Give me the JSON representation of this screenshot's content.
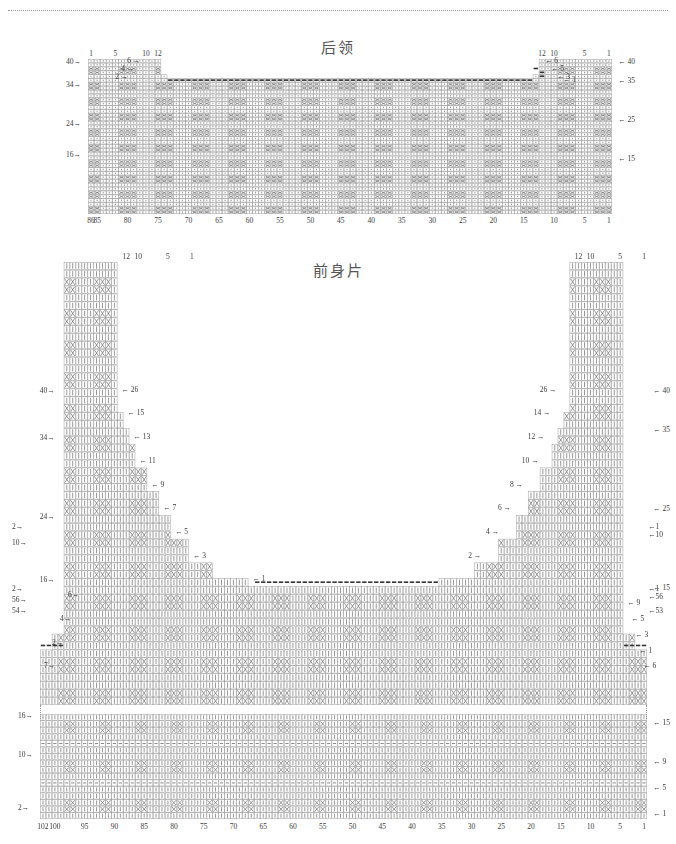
{
  "page": {
    "width": 676,
    "height": 844,
    "background": "#ffffff",
    "ink": "#3a3a3a"
  },
  "charts": [
    {
      "id": "back-collar",
      "title": "后领",
      "title_meaning": "back-neck-piece",
      "cols": 86,
      "rows": 40,
      "bottom_axis_ticks": [
        86,
        85,
        80,
        75,
        70,
        65,
        60,
        55,
        50,
        45,
        40,
        35,
        30,
        25,
        20,
        15,
        10,
        5,
        1
      ],
      "top_axis_left_ticks": [
        12,
        10,
        5,
        1
      ],
      "top_axis_right_ticks": [
        12,
        10,
        5,
        1
      ],
      "left_row_labels": [
        {
          "row": 40,
          "text": "40"
        },
        {
          "row": 34,
          "text": "34"
        },
        {
          "row": 24,
          "text": "24"
        },
        {
          "row": 16,
          "text": "16"
        }
      ],
      "right_row_labels": [
        {
          "row": 40,
          "text": "40"
        },
        {
          "row": 35,
          "text": "35"
        },
        {
          "row": 25,
          "text": "25"
        },
        {
          "row": 15,
          "text": "15"
        }
      ],
      "left_shoulder_steps": [
        {
          "text": "6",
          "row": 40
        },
        {
          "text": "5",
          "row": 38
        },
        {
          "text": "3",
          "row": 36
        },
        {
          "text": "1",
          "row": 35
        }
      ],
      "right_shoulder_steps": [
        {
          "text": "6",
          "row": 40
        },
        {
          "text": "4",
          "row": 38
        },
        {
          "text": "2",
          "row": 36
        }
      ]
    },
    {
      "id": "front-body",
      "title": "前身片",
      "title_meaning": "front-body-piece",
      "cols": 102,
      "rows": 56,
      "bottom_axis_ticks": [
        102,
        100,
        95,
        90,
        85,
        80,
        75,
        70,
        65,
        60,
        55,
        50,
        45,
        40,
        35,
        30,
        25,
        20,
        15,
        10,
        5,
        1
      ],
      "top_axis_left_ticks": [
        12,
        10,
        5,
        1
      ],
      "top_axis_right_ticks": [
        12,
        10,
        5,
        1
      ],
      "left_row_labels": [
        {
          "row": 40,
          "text": "40"
        },
        {
          "row": 34,
          "text": "34"
        },
        {
          "row": 24,
          "text": "24"
        },
        {
          "row": 16,
          "text": "16"
        },
        {
          "row": 9,
          "text": "9"
        },
        {
          "row": 2,
          "text": "2"
        },
        {
          "row": 10,
          "text": "10"
        },
        {
          "row": 56,
          "text": "56"
        },
        {
          "row": 54,
          "text": "54"
        }
      ],
      "right_row_labels": [
        {
          "row": 40,
          "text": "40"
        },
        {
          "row": 35,
          "text": "35"
        },
        {
          "row": 25,
          "text": "25"
        },
        {
          "row": 15,
          "text": "15"
        },
        {
          "row": 9,
          "text": "9"
        },
        {
          "row": 1,
          "text": "1"
        },
        {
          "row": 10,
          "text": "10"
        },
        {
          "row": 56,
          "text": "56"
        },
        {
          "row": 53,
          "text": "53"
        }
      ],
      "left_neck_steps": [
        "26",
        "15",
        "13",
        "11",
        "9",
        "7",
        "5",
        "3",
        "1"
      ],
      "right_neck_steps": [
        "26",
        "14",
        "12",
        "10",
        "8",
        "6",
        "4",
        "2"
      ],
      "left_armhole_steps": [
        "6",
        "4",
        "2",
        "7"
      ],
      "right_armhole_steps": [
        "9",
        "5",
        "3",
        "1",
        "6"
      ],
      "hem_left_row_labels": [
        {
          "row": 16,
          "text": "16"
        },
        {
          "row": 10,
          "text": "10"
        },
        {
          "row": 2,
          "text": "2"
        }
      ],
      "hem_right_row_labels": [
        {
          "row": 15,
          "text": "15"
        },
        {
          "row": 9,
          "text": "9"
        },
        {
          "row": 5,
          "text": "5"
        },
        {
          "row": 1,
          "text": "1"
        }
      ],
      "hem_axis_ticks": [
        102,
        100,
        95,
        90,
        85,
        80,
        75,
        70,
        65,
        60,
        55,
        50,
        45,
        40,
        35,
        30,
        25,
        20,
        15,
        10,
        5,
        1
      ]
    }
  ],
  "symbols": {
    "knit": "|",
    "cable_cross": "X",
    "bind_off": "▬",
    "arrow_right": "→",
    "arrow_left": "←"
  }
}
